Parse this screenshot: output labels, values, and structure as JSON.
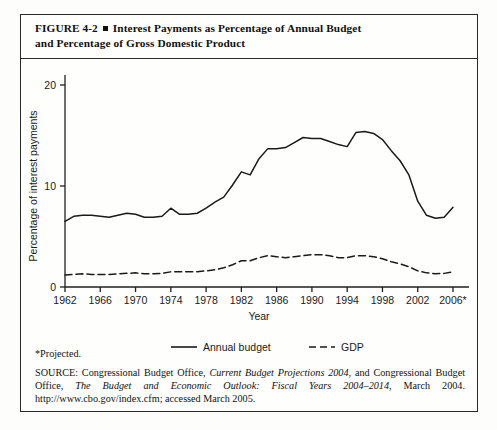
{
  "figure": {
    "title_line1": "FIGURE  4-2",
    "title_line2": "Interest Payments as Percentage of Annual Budget",
    "title_line3": "and Percentage of Gross Domestic Product",
    "footnote": "*Projected.",
    "source_prefix": "SOURCE: Congressional Budget Office, ",
    "source_italic1": "Current Budget Projections 2004",
    "source_mid": ", and Congressional Budget Office, ",
    "source_italic2": "The Budget and Economic Outlook: Fiscal Years 2004–2014",
    "source_suffix": ", March 2004. http://www.cbo.gov/index.cfm; accessed March 2005."
  },
  "chart_data": {
    "type": "line",
    "title": "Interest Payments as Percentage of Annual Budget and Percentage of Gross Domestic Product",
    "xlabel": "Year",
    "ylabel": "Percentage of interest payments",
    "xlim": [
      1962,
      2006
    ],
    "ylim": [
      0,
      20
    ],
    "yticks": [
      0,
      10,
      20
    ],
    "ytick_labels": [
      "0",
      "10",
      "20"
    ],
    "xticks": [
      1962,
      1966,
      1970,
      1974,
      1978,
      1982,
      1986,
      1990,
      1994,
      1998,
      2002,
      2006
    ],
    "xtick_labels": [
      "1962",
      "1966",
      "1970",
      "1974",
      "1978",
      "1982",
      "1986",
      "1990",
      "1994",
      "1998",
      "2002",
      "2006*"
    ],
    "grid": false,
    "legend_position": "below-axes",
    "x": [
      1962,
      1963,
      1964,
      1965,
      1966,
      1967,
      1968,
      1969,
      1970,
      1971,
      1972,
      1973,
      1974,
      1975,
      1976,
      1977,
      1978,
      1979,
      1980,
      1981,
      1982,
      1983,
      1984,
      1985,
      1986,
      1987,
      1988,
      1989,
      1990,
      1991,
      1992,
      1993,
      1994,
      1995,
      1996,
      1997,
      1998,
      1999,
      2000,
      2001,
      2002,
      2003,
      2004,
      2005,
      2006
    ],
    "series": [
      {
        "name": "Annual budget",
        "style": "solid",
        "color": "#1a1a1a",
        "values": [
          6.5,
          7.0,
          7.1,
          7.1,
          7.0,
          6.9,
          7.1,
          7.3,
          7.2,
          6.9,
          6.9,
          7.0,
          7.8,
          7.2,
          7.2,
          7.3,
          7.8,
          8.4,
          8.9,
          10.1,
          11.4,
          11.1,
          12.7,
          13.7,
          13.7,
          13.8,
          14.3,
          14.8,
          14.7,
          14.7,
          14.4,
          14.1,
          13.9,
          15.3,
          15.4,
          15.2,
          14.6,
          13.5,
          12.5,
          11.1,
          8.5,
          7.1,
          6.8,
          6.9,
          7.9
        ]
      },
      {
        "name": "GDP",
        "style": "dashed",
        "color": "#1a1a1a",
        "values": [
          1.2,
          1.25,
          1.3,
          1.25,
          1.25,
          1.25,
          1.3,
          1.35,
          1.4,
          1.3,
          1.3,
          1.35,
          1.5,
          1.5,
          1.5,
          1.5,
          1.6,
          1.7,
          1.9,
          2.2,
          2.6,
          2.6,
          2.9,
          3.1,
          3.0,
          2.9,
          3.0,
          3.1,
          3.2,
          3.2,
          3.1,
          2.9,
          2.9,
          3.1,
          3.1,
          3.0,
          2.8,
          2.5,
          2.3,
          2.0,
          1.6,
          1.4,
          1.3,
          1.35,
          1.5
        ]
      }
    ],
    "legend": [
      {
        "label": "Annual budget",
        "style": "solid"
      },
      {
        "label": "GDP",
        "style": "dashed"
      }
    ]
  }
}
